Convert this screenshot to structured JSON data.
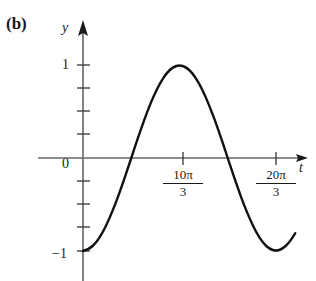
{
  "figure": {
    "part_label": "(b)",
    "axes": {
      "x_name": "t",
      "y_name": "y"
    },
    "y_tick_labels": {
      "one": "1",
      "zero": "0",
      "neg_one": "−1"
    },
    "x_tick_labels": [
      {
        "numerator": "10π",
        "denominator": "3"
      },
      {
        "numerator": "20π",
        "denominator": "3"
      }
    ],
    "colors": {
      "curve": "#111111",
      "axis": "#555555",
      "text": "#1a1a1a",
      "background": "#ffffff"
    }
  },
  "chart_data": {
    "type": "line",
    "title": "",
    "subtitle": "",
    "xlabel": "t",
    "ylabel": "y",
    "xlim": [
      0,
      7.6
    ],
    "ylim": [
      -1.35,
      1.35
    ],
    "grid": false,
    "legend": null,
    "x_ticks": [
      3.333,
      6.667
    ],
    "x_tick_labels": [
      "10π/3",
      "20π/3"
    ],
    "x_tick_units": "multiples of π/3 scaled; ticks at 10π/3 and 20π/3",
    "y_ticks": [
      -1,
      0,
      1
    ],
    "y_tick_labels": [
      "−1",
      "0",
      "1"
    ],
    "y_minor_ticks": [
      -0.75,
      -0.5,
      -0.25,
      0.25,
      0.5,
      0.75
    ],
    "amplitude": 1,
    "period": "20π/3",
    "minimum_points": [
      {
        "x": 0,
        "y": -1
      },
      {
        "x": 6.667,
        "y": -1
      }
    ],
    "maximum_points": [
      {
        "x": 3.333,
        "y": 1
      }
    ],
    "zero_crossings": [
      1.667,
      5.0
    ],
    "series": [
      {
        "name": "y(t)",
        "x": [
          0.0,
          0.222,
          0.444,
          0.667,
          0.889,
          1.111,
          1.333,
          1.556,
          1.778,
          2.0,
          2.222,
          2.444,
          2.667,
          2.889,
          3.111,
          3.333,
          3.556,
          3.778,
          4.0,
          4.222,
          4.444,
          4.667,
          4.889,
          5.111,
          5.333,
          5.556,
          5.778,
          6.0,
          6.222,
          6.444,
          6.667,
          6.889,
          7.111,
          7.333
        ],
        "y": [
          -1.0,
          -0.978,
          -0.914,
          -0.809,
          -0.669,
          -0.5,
          -0.309,
          -0.105,
          0.105,
          0.309,
          0.5,
          0.669,
          0.809,
          0.914,
          0.978,
          1.0,
          0.978,
          0.914,
          0.809,
          0.669,
          0.5,
          0.309,
          0.105,
          -0.105,
          -0.309,
          -0.5,
          -0.669,
          -0.809,
          -0.914,
          -0.978,
          -1.0,
          -0.978,
          -0.914,
          -0.809
        ]
      }
    ]
  }
}
